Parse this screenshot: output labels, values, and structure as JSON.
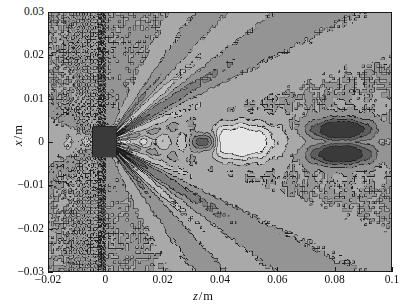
{
  "figure": {
    "kind": "contour-plot",
    "background_color": "#ffffff",
    "plot_background_color": "#a9a9a9",
    "frame_color": "#1a1a1a"
  },
  "axes": {
    "x_axis": {
      "title_variable": "z",
      "title_unit": "m",
      "title_separator": "/",
      "title_full": "z / m",
      "min": -0.02,
      "max": 0.1,
      "tick_step": 0.02,
      "tick_labels": [
        "-0.02",
        "0",
        "0.02",
        "0.04",
        "0.06",
        "0.08",
        "0.1"
      ],
      "tick_values": [
        -0.02,
        0,
        0.02,
        0.04,
        0.06,
        0.08,
        0.1
      ]
    },
    "y_axis": {
      "title_variable": "x",
      "title_unit": "m",
      "title_separator": "/",
      "title_full": "x / m",
      "min": -0.03,
      "max": 0.03,
      "tick_step": 0.01,
      "tick_labels": [
        "0.03",
        "0.02",
        "0.01",
        "0",
        "-0.01",
        "-0.02",
        "-0.03"
      ],
      "tick_values": [
        0.03,
        0.02,
        0.01,
        0,
        -0.01,
        -0.02,
        -0.03
      ]
    }
  },
  "chart_data": {
    "type": "heatmap",
    "title": "",
    "xlabel": "z / m",
    "ylabel": "x / m",
    "xlim": [
      -0.02,
      0.1
    ],
    "ylim": [
      -0.03,
      0.03
    ],
    "grid": false,
    "legend": "none",
    "colormap": "grayscale",
    "colormap_levels": [
      "#3a3a3a",
      "#5e5e5e",
      "#7d7d7d",
      "#949494",
      "#a9a9a9",
      "#bdbdbd",
      "#d4d4d4",
      "#e6e6e6"
    ],
    "features": [
      {
        "name": "source-spot",
        "shape": "dark-rectangle",
        "z_center": -0.0005,
        "x_center": 0,
        "z_extent": [
          -0.004,
          0.004
        ],
        "x_extent": [
          -0.0035,
          0.0035
        ],
        "level": "#3a3a3a"
      },
      {
        "name": "near-field-sidelobe-ring",
        "shape": "speckle-cluster",
        "z_center": -0.018,
        "x_center": 0,
        "level": "#7d7d7d"
      },
      {
        "name": "upper-diagonal-lobe-band",
        "shape": "striped-fan",
        "origin_z": -0.016,
        "origin_x": 0.004,
        "angle_deg": 20,
        "level": "#7d7d7d"
      },
      {
        "name": "lower-diagonal-lobe-band",
        "shape": "striped-fan",
        "origin_z": -0.016,
        "origin_x": -0.004,
        "angle_deg": -20,
        "level": "#7d7d7d"
      },
      {
        "name": "on-axis-bright-lobe",
        "shape": "elongated-ellipse",
        "z_extent": [
          0.038,
          0.056
        ],
        "x_extent": [
          -0.003,
          0.003
        ],
        "level": "#e6e6e6"
      },
      {
        "name": "on-axis-focus-spot",
        "shape": "small-dark-ellipse",
        "z_center": 0.0345,
        "x_center": 0,
        "level": "#3a3a3a"
      },
      {
        "name": "far-field-bowtie",
        "shape": "double-lobe-bowtie",
        "z_center": 0.0825,
        "x_center": 0,
        "z_extent": [
          0.074,
          0.092
        ],
        "x_extent": [
          -0.006,
          0.006
        ],
        "level": "#3a3a3a"
      },
      {
        "name": "right-edge-slivers",
        "shape": "thin-diagonal-stripes",
        "z_extent": [
          0.086,
          0.1
        ],
        "x_extent": [
          0.008,
          0.03
        ],
        "level": "#6a6a6a"
      }
    ]
  }
}
